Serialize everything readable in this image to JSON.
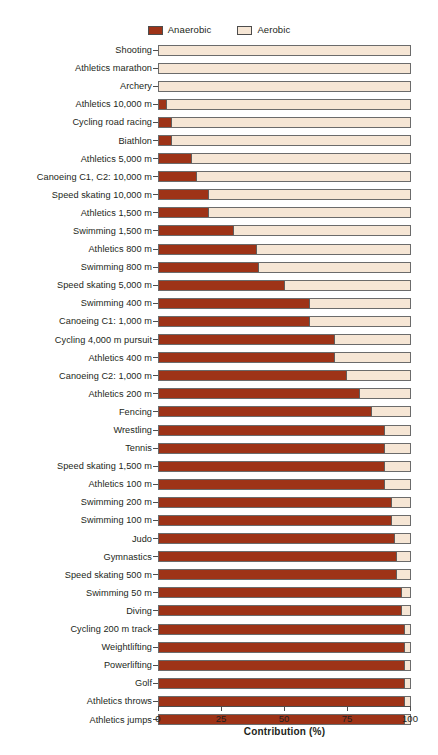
{
  "legend": {
    "entries": [
      {
        "label": "Anaerobic",
        "color": "#9e3317",
        "icon": "legend-swatch-filled"
      },
      {
        "label": "Aerobic",
        "color": "#f6e6d5",
        "icon": "legend-swatch-open"
      }
    ]
  },
  "axis": {
    "x_title": "Contribution (%)",
    "x_ticks": [
      "0",
      "25",
      "50",
      "75",
      "100"
    ]
  },
  "chart_data": {
    "type": "bar",
    "orientation": "horizontal",
    "stacked": true,
    "title": "",
    "xlabel": "Contribution (%)",
    "ylabel": "",
    "xlim": [
      0,
      100
    ],
    "grid": false,
    "legend_position": "top-center",
    "categories": [
      "Shooting",
      "Athletics marathon",
      "Archery",
      "Athletics 10,000 m",
      "Cycling road racing",
      "Biathlon",
      "Athletics 5,000 m",
      "Canoeing C1, C2: 10,000 m",
      "Speed skating 10,000 m",
      "Athletics 1,500 m",
      "Swimming 1,500 m",
      "Athletics 800 m",
      "Swimming 800 m",
      "Speed skating 5,000 m",
      "Swimming 400 m",
      "Canoeing C1: 1,000 m",
      "Cycling 4,000 m pursuit",
      "Athletics 400 m",
      "Canoeing C2: 1,000 m",
      "Athletics 200 m",
      "Fencing",
      "Wrestling",
      "Tennis",
      "Speed skating 1,500 m",
      "Athletics 100 m",
      "Swimming 200 m",
      "Swimming 100 m",
      "Judo",
      "Gymnastics",
      "Speed skating 500 m",
      "Swimming 50 m",
      "Diving",
      "Cycling 200 m track",
      "Weightlifting",
      "Powerlifting",
      "Golf",
      "Athletics throws",
      "Athletics jumps"
    ],
    "series": [
      {
        "name": "Anaerobic",
        "color": "#9e3317",
        "values": [
          0,
          0,
          0,
          3,
          5,
          5,
          13,
          15,
          20,
          20,
          30,
          39,
          40,
          50,
          60,
          60,
          70,
          70,
          75,
          80,
          85,
          90,
          90,
          90,
          90,
          93,
          93,
          94,
          95,
          95,
          97,
          97,
          98,
          98,
          98,
          98,
          98,
          98
        ]
      },
      {
        "name": "Aerobic",
        "color": "#f6e6d5",
        "values": [
          100,
          100,
          100,
          97,
          95,
          95,
          87,
          85,
          80,
          80,
          70,
          61,
          60,
          50,
          40,
          40,
          30,
          30,
          25,
          20,
          15,
          10,
          10,
          10,
          10,
          7,
          7,
          6,
          5,
          5,
          3,
          3,
          2,
          2,
          2,
          2,
          2,
          2
        ]
      }
    ]
  }
}
